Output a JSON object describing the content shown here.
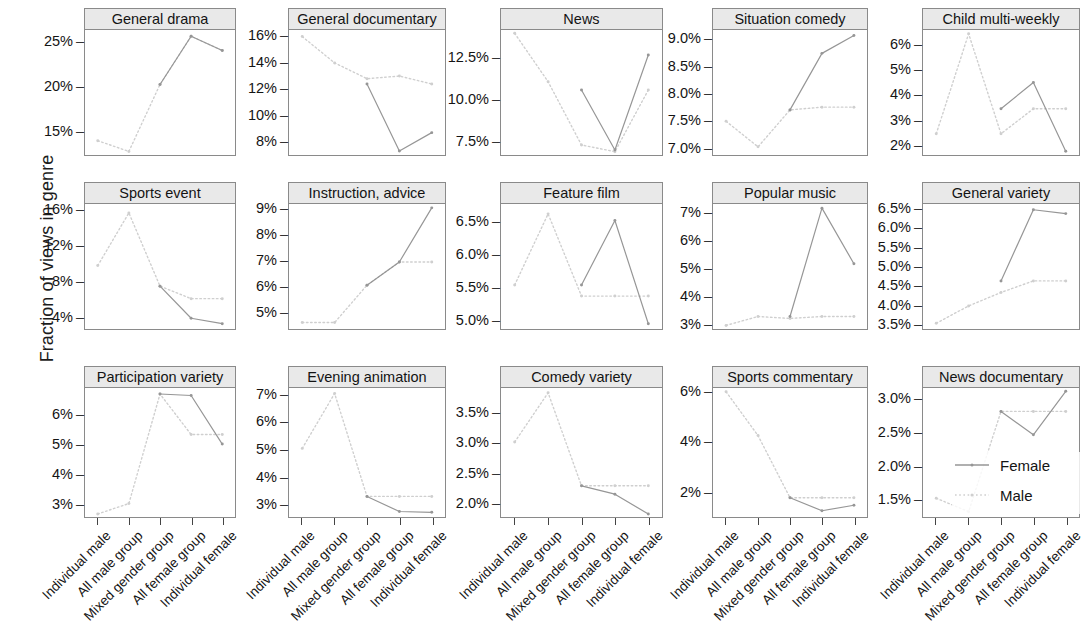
{
  "chart_data": {
    "type": "line",
    "title": "",
    "xlabel": "",
    "ylabel": "Fraction of views in genre",
    "grid": false,
    "legend_position": "bottom-right",
    "categories": [
      "Individual male",
      "All male group",
      "Mixed gender group",
      "All female group",
      "Individual female"
    ],
    "series_names": [
      "Female",
      "Male"
    ],
    "series_styles": {
      "Female": "solid",
      "Male": "dotted"
    },
    "panels": [
      {
        "title": "General drama",
        "ylim": [
          12.2,
          26.2
        ],
        "yticks": [
          15,
          20,
          25
        ],
        "yticklabels": [
          "15%",
          "20%",
          "25%"
        ],
        "series": [
          {
            "name": "Male",
            "values": [
              13.8,
              12.6,
              20.1,
              25.5,
              23.9
            ]
          },
          {
            "name": "Female",
            "values": [
              null,
              null,
              20.1,
              25.5,
              23.9
            ]
          }
        ]
      },
      {
        "title": "General documentary",
        "ylim": [
          6.9,
          16.4
        ],
        "yticks": [
          8,
          10,
          12,
          14,
          16
        ],
        "yticklabels": [
          "8%",
          "10%",
          "12%",
          "14%",
          "16%"
        ],
        "series": [
          {
            "name": "Male",
            "values": [
              15.9,
              13.9,
              12.7,
              12.9,
              12.3
            ]
          },
          {
            "name": "Female",
            "values": [
              null,
              null,
              12.3,
              7.2,
              8.6
            ]
          }
        ]
      },
      {
        "title": "News",
        "ylim": [
          6.6,
          14.1
        ],
        "yticks": [
          7.5,
          10.0,
          12.5
        ],
        "yticklabels": [
          "7.5%",
          "10.0%",
          "12.5%"
        ],
        "series": [
          {
            "name": "Male",
            "values": [
              13.9,
              11.0,
              7.2,
              6.8,
              10.5
            ]
          },
          {
            "name": "Female",
            "values": [
              null,
              null,
              10.5,
              6.9,
              12.6
            ]
          }
        ]
      },
      {
        "title": "Situation comedy",
        "ylim": [
          6.85,
          9.15
        ],
        "yticks": [
          7.0,
          7.5,
          8.0,
          8.5,
          9.0
        ],
        "yticklabels": [
          "7.0%",
          "7.5%",
          "8.0%",
          "8.5%",
          "9.0%"
        ],
        "series": [
          {
            "name": "Male",
            "values": [
              7.47,
              7.0,
              7.68,
              7.73,
              7.73
            ]
          },
          {
            "name": "Female",
            "values": [
              null,
              null,
              7.68,
              8.72,
              9.05
            ]
          }
        ]
      },
      {
        "title": "Child multi-weekly",
        "ylim": [
          1.55,
          6.55
        ],
        "yticks": [
          2,
          3,
          4,
          5,
          6
        ],
        "yticklabels": [
          "2%",
          "3%",
          "4%",
          "5%",
          "6%"
        ],
        "series": [
          {
            "name": "Male",
            "values": [
              2.4,
              6.4,
              2.4,
              3.4,
              3.4
            ]
          },
          {
            "name": "Female",
            "values": [
              null,
              null,
              3.4,
              4.45,
              1.7
            ]
          }
        ]
      },
      {
        "title": "Sports event",
        "ylim": [
          2.6,
          16.6
        ],
        "yticks": [
          4,
          8,
          12,
          16
        ],
        "yticklabels": [
          "4%",
          "8%",
          "12%",
          "16%"
        ],
        "series": [
          {
            "name": "Male",
            "values": [
              9.7,
              15.6,
              7.4,
              6.0,
              6.0
            ]
          },
          {
            "name": "Female",
            "values": [
              null,
              null,
              7.4,
              3.8,
              3.2
            ]
          }
        ]
      },
      {
        "title": "Instruction, advice",
        "ylim": [
          4.3,
          9.15
        ],
        "yticks": [
          5,
          6,
          7,
          8,
          9
        ],
        "yticklabels": [
          "5%",
          "6%",
          "7%",
          "8%",
          "9%"
        ],
        "series": [
          {
            "name": "Male",
            "values": [
              4.55,
              4.55,
              6.0,
              6.9,
              6.9
            ]
          },
          {
            "name": "Female",
            "values": [
              null,
              null,
              6.0,
              6.9,
              9.0
            ]
          }
        ]
      },
      {
        "title": "Feature film",
        "ylim": [
          4.85,
          6.75
        ],
        "yticks": [
          5.0,
          5.5,
          6.0,
          6.5
        ],
        "yticklabels": [
          "5.0%",
          "5.5%",
          "6.0%",
          "6.5%"
        ],
        "series": [
          {
            "name": "Male",
            "values": [
              5.52,
              6.6,
              5.35,
              5.35,
              5.35
            ]
          },
          {
            "name": "Female",
            "values": [
              null,
              null,
              5.52,
              6.5,
              4.93
            ]
          }
        ]
      },
      {
        "title": "Popular music",
        "ylim": [
          2.8,
          7.3
        ],
        "yticks": [
          3,
          4,
          5,
          6,
          7
        ],
        "yticklabels": [
          "3%",
          "4%",
          "5%",
          "6%",
          "7%"
        ],
        "series": [
          {
            "name": "Male",
            "values": [
              2.93,
              3.25,
              3.18,
              3.25,
              3.25
            ]
          },
          {
            "name": "Female",
            "values": [
              null,
              null,
              3.25,
              7.15,
              5.15
            ]
          }
        ]
      },
      {
        "title": "General variety",
        "ylim": [
          3.35,
          6.6
        ],
        "yticks": [
          3.5,
          4.0,
          4.5,
          5.0,
          5.5,
          6.0,
          6.5
        ],
        "yticklabels": [
          "3.5%",
          "4.0%",
          "4.5%",
          "5.0%",
          "5.5%",
          "6.0%",
          "6.5%"
        ],
        "series": [
          {
            "name": "Male",
            "values": [
              3.5,
              3.95,
              4.3,
              4.6,
              4.6
            ]
          },
          {
            "name": "Female",
            "values": [
              null,
              null,
              4.6,
              6.45,
              6.35
            ]
          }
        ]
      },
      {
        "title": "Participation variety",
        "ylim": [
          2.55,
          6.85
        ],
        "yticks": [
          3,
          4,
          5,
          6
        ],
        "yticklabels": [
          "3%",
          "4%",
          "5%",
          "6%"
        ],
        "series": [
          {
            "name": "Male",
            "values": [
              2.65,
              3.0,
              6.65,
              5.3,
              5.3
            ]
          },
          {
            "name": "Female",
            "values": [
              null,
              null,
              6.65,
              6.6,
              4.98
            ]
          }
        ]
      },
      {
        "title": "Evening animation",
        "ylim": [
          2.5,
          7.2
        ],
        "yticks": [
          3,
          4,
          5,
          6,
          7
        ],
        "yticklabels": [
          "3%",
          "4%",
          "5%",
          "6%",
          "7%"
        ],
        "series": [
          {
            "name": "Male",
            "values": [
              5.0,
              7.0,
              3.25,
              3.25,
              3.25
            ]
          },
          {
            "name": "Female",
            "values": [
              null,
              null,
              3.25,
              2.7,
              2.67
            ]
          }
        ]
      },
      {
        "title": "Comedy variety",
        "ylim": [
          1.75,
          3.9
        ],
        "yticks": [
          2.0,
          2.5,
          3.0,
          3.5
        ],
        "yticklabels": [
          "2.0%",
          "2.5%",
          "3.0%",
          "3.5%"
        ],
        "series": [
          {
            "name": "Male",
            "values": [
              3.0,
              3.82,
              2.27,
              2.27,
              2.27
            ]
          },
          {
            "name": "Female",
            "values": [
              null,
              null,
              2.27,
              2.13,
              1.8
            ]
          }
        ]
      },
      {
        "title": "Sports commentary",
        "ylim": [
          0.95,
          6.1
        ],
        "yticks": [
          2,
          4,
          6
        ],
        "yticklabels": [
          "2%",
          "4%",
          "6%"
        ],
        "series": [
          {
            "name": "Male",
            "values": [
              5.95,
              4.2,
              1.72,
              1.72,
              1.72
            ]
          },
          {
            "name": "Female",
            "values": [
              null,
              null,
              1.72,
              1.2,
              1.42
            ]
          }
        ]
      },
      {
        "title": "News documentary",
        "ylim": [
          1.22,
          3.15
        ],
        "yticks": [
          1.5,
          2.0,
          2.5,
          3.0
        ],
        "yticklabels": [
          "1.5%",
          "2.0%",
          "2.5%",
          "3.0%"
        ],
        "series": [
          {
            "name": "Male",
            "values": [
              1.5,
              1.3,
              2.8,
              2.8,
              2.8
            ]
          },
          {
            "name": "Female",
            "values": [
              null,
              null,
              2.8,
              2.45,
              3.1
            ]
          }
        ]
      }
    ],
    "colors": {
      "female": "#8a8a8a",
      "male": "#c9c9c9",
      "panel_strip": "#e9e9e9",
      "border": "#8a8a8a"
    }
  },
  "legend": {
    "items": [
      {
        "label": "Female",
        "style": "solid"
      },
      {
        "label": "Male",
        "style": "dotted"
      }
    ]
  }
}
